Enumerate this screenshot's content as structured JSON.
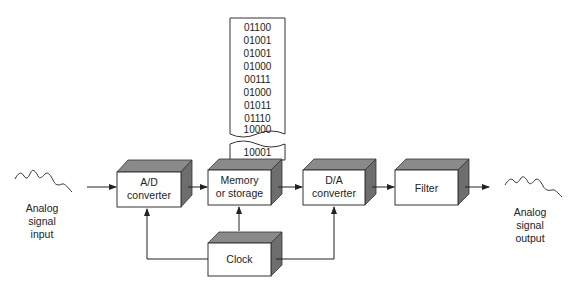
{
  "input": {
    "label_lines": [
      "Analog",
      "signal",
      "input"
    ]
  },
  "output": {
    "label_lines": [
      "Analog",
      "signal",
      "output"
    ]
  },
  "blocks": {
    "ad": {
      "lines": [
        "A/D",
        "converter"
      ]
    },
    "memory": {
      "lines": [
        "Memory",
        "or storage"
      ]
    },
    "da": {
      "lines": [
        "D/A",
        "converter"
      ]
    },
    "filter": {
      "lines": [
        "Filter"
      ]
    },
    "clock": {
      "lines": [
        "Clock"
      ]
    }
  },
  "memory_tape": {
    "words": [
      "01100",
      "01001",
      "01001",
      "01000",
      "00111",
      "01000",
      "01011",
      "01110",
      "10000"
    ],
    "current_word": "10001"
  },
  "colors": {
    "box_top": "#8a8a8a",
    "box_side": "#6e6e6e",
    "line": "#222222"
  }
}
